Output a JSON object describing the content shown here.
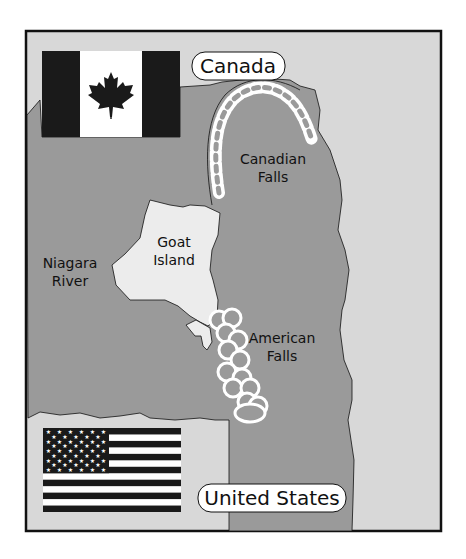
{
  "map": {
    "title": "Niagara Falls area map",
    "colors": {
      "land": "#d8d8d8",
      "water": "#9a9a9a",
      "island": "#ececec",
      "falls_foam": "#ffffff",
      "outline": "#111111",
      "flag_dark": "#1a1a1a",
      "flag_light": "#ffffff"
    },
    "labels": {
      "canada": "Canada",
      "united_states": "United States",
      "canadian_falls_line1": "Canadian",
      "canadian_falls_line2": "Falls",
      "american_falls_line1": "American",
      "american_falls_line2": "Falls",
      "goat_island_line1": "Goat",
      "goat_island_line2": "Island",
      "niagara_river_line1": "Niagara",
      "niagara_river_line2": "River"
    },
    "flags": {
      "canada": "canada-flag",
      "united_states": "usa-flag"
    }
  }
}
